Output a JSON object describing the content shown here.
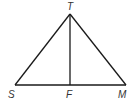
{
  "diagram": {
    "type": "triangle-with-altitude",
    "colors": {
      "stroke": "#1a1a1a",
      "label": "#333333",
      "background": "#ffffff"
    },
    "points": {
      "T": {
        "label": "T",
        "x": 70,
        "y": 14
      },
      "S": {
        "label": "S",
        "x": 15,
        "y": 85
      },
      "F": {
        "label": "F",
        "x": 70,
        "y": 85
      },
      "M": {
        "label": "M",
        "x": 126,
        "y": 85
      }
    },
    "segments": [
      {
        "from": "T",
        "to": "S"
      },
      {
        "from": "T",
        "to": "M"
      },
      {
        "from": "S",
        "to": "M"
      },
      {
        "from": "T",
        "to": "F"
      }
    ]
  }
}
